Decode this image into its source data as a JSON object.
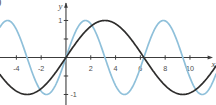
{
  "figure": {
    "corner_mark": ")"
  },
  "chart_data": {
    "type": "line",
    "title": "",
    "xlabel": "x",
    "ylabel": "y",
    "xlim": [
      -5.32,
      12.1
    ],
    "ylim": [
      -1.284,
      1.554
    ],
    "x_ticks": [
      -4,
      -2,
      2,
      4,
      6,
      8,
      10
    ],
    "y_ticks_labeled": [
      1,
      -1
    ],
    "y_ticks_minor": [
      0.5,
      -0.5
    ],
    "grid": false,
    "legend_position": "none",
    "axis_color": "#3c3c3c",
    "tick_label_color": "#4e4e4e",
    "series": [
      {
        "name": "y = sin x",
        "function": "sine",
        "amplitude": 1,
        "angular_frequency": 1,
        "phase": 0,
        "color": "#8fc0da",
        "key_points": {
          "zeros_x": [
            -3.142,
            0,
            3.142,
            6.283,
            9.425
          ],
          "maxima_x": [
            -4.712,
            1.571,
            7.854
          ],
          "minima_x": [
            -1.571,
            4.712,
            10.996
          ],
          "max_y": 1,
          "min_y": -1
        }
      },
      {
        "name": "y = sin(x/2)",
        "function": "sine",
        "amplitude": 1,
        "angular_frequency": 0.5,
        "phase": 0,
        "color": "#2e2d2c",
        "key_points": {
          "zeros_x": [
            0,
            6.283
          ],
          "maxima_x": [
            3.142
          ],
          "minima_x": [
            -3.142,
            9.425
          ],
          "max_y": 1,
          "min_y": -1
        }
      }
    ]
  }
}
